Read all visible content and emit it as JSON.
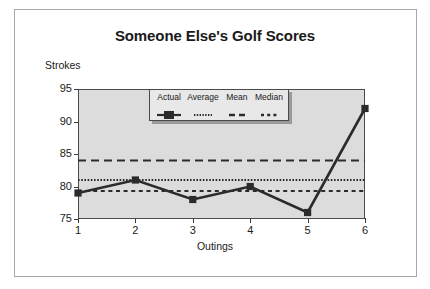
{
  "chart_data": {
    "type": "line",
    "title": "Someone Else's Golf Scores",
    "xlabel": "Outings",
    "ylabel": "Strokes",
    "categories": [
      "1",
      "2",
      "3",
      "4",
      "5",
      "6"
    ],
    "x": [
      1,
      2,
      3,
      4,
      5,
      6
    ],
    "xlim": [
      1,
      6
    ],
    "ylim": [
      75,
      95
    ],
    "yticks": [
      "95",
      "90",
      "85",
      "80",
      "75"
    ],
    "ytick_values": [
      95,
      90,
      85,
      80,
      75
    ],
    "xticks": [
      "1",
      "2",
      "3",
      "4",
      "5",
      "6"
    ],
    "grid": false,
    "legend_position": "upper-center-inside",
    "series": [
      {
        "name": "Actual",
        "style": "solid-with-square-markers",
        "values": [
          79,
          81,
          78,
          80,
          76,
          92
        ]
      },
      {
        "name": "Average",
        "style": "fine-dotted-horizontal-reference",
        "value": 81
      },
      {
        "name": "Mean",
        "style": "long-dashed-horizontal-reference",
        "value": 84
      },
      {
        "name": "Median",
        "style": "short-dashed-horizontal-reference",
        "value": 79.3
      }
    ]
  },
  "legend": {
    "entries": [
      {
        "label": "Actual",
        "swatch": "solid-line-square-marker-swatch"
      },
      {
        "label": "Average",
        "swatch": "fine-dotted-line-swatch"
      },
      {
        "label": "Mean",
        "swatch": "long-dashed-line-swatch"
      },
      {
        "label": "Median",
        "swatch": "short-dashed-line-swatch"
      }
    ]
  },
  "colors": {
    "plot_background": "#dcdcdc",
    "figure_background": "#ffffff",
    "axis": "#3c3c3c",
    "series_line": "#2b2b2b",
    "legend_background": "#e8e8e8",
    "frame": "#a8a8a8"
  }
}
